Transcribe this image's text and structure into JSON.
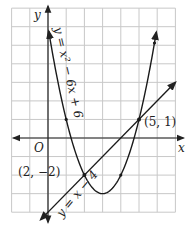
{
  "figure": {
    "type": "coordinate-graph",
    "grid": {
      "x_min": -2,
      "x_max": 7,
      "y_min": -4,
      "y_max": 7,
      "step": 1
    },
    "axes": {
      "x_label": "x",
      "y_label": "y",
      "origin_label": "O"
    },
    "curves": [
      {
        "name": "parabola",
        "equation_label": "y = x² − 6x + 6",
        "expression": "x^2 - 6x + 6",
        "vertex": [
          3,
          -3
        ]
      },
      {
        "name": "line",
        "equation_label": "y = x − 4",
        "expression": "x - 4"
      }
    ],
    "intersections": [
      {
        "label": "(2, −2)",
        "x": 2,
        "y": -2
      },
      {
        "label": "(5, 1)",
        "x": 5,
        "y": 1
      }
    ],
    "colors": {
      "grid": "#c8c8c8",
      "axis": "#222222",
      "curve": "#1a1a1a",
      "background": "#ffffff"
    }
  }
}
